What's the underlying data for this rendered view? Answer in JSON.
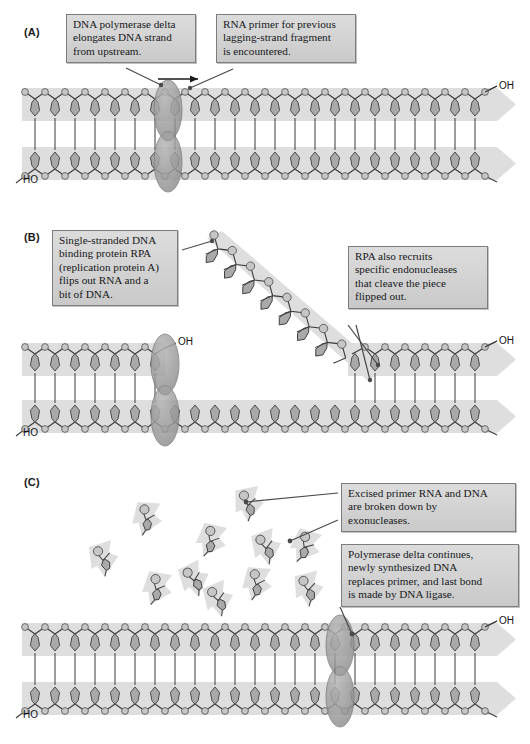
{
  "figure": {
    "background_color": "#ffffff",
    "ribbon_color": "#d9d9d9",
    "base_color": "#a8a8a8",
    "base_light_color": "#bfbfbf",
    "phosphate_color": "#c2c2c2",
    "protein_color": "#9a9a9a",
    "stroke_color": "#3c3c3c",
    "callout_fill": "#d4d4d4",
    "callout_border": "#7d7d7d"
  },
  "panels": [
    {
      "id": "A",
      "label": "(A)",
      "callouts": [
        {
          "name": "polymerase-delta-callout",
          "lines": [
            "DNA polymerase delta",
            "elongates DNA strand",
            "from upstream."
          ]
        },
        {
          "name": "rna-primer-callout",
          "lines": [
            "RNA primer for previous",
            "lagging-strand fragment",
            "is encountered."
          ]
        }
      ],
      "end_labels": [
        {
          "name": "top-strand-oh-label",
          "text": "OH"
        },
        {
          "name": "bottom-strand-ho-label",
          "text": "HO"
        }
      ],
      "proteins": [
        {
          "name": "dna-polymerase-delta",
          "shape": "double-ellipse"
        }
      ]
    },
    {
      "id": "B",
      "label": "(B)",
      "callouts": [
        {
          "name": "rpa-binding-callout",
          "lines": [
            "Single-stranded DNA",
            "binding protein RPA",
            "(replication protein A)",
            "flips out RNA and a",
            "bit of DNA."
          ]
        },
        {
          "name": "endonuclease-callout",
          "lines": [
            "RPA also recruits",
            "specific endonucleases",
            "that cleave the piece",
            "flipped out."
          ]
        }
      ],
      "end_labels": [
        {
          "name": "nascent-strand-oh-label",
          "text": "OH"
        },
        {
          "name": "top-strand-right-oh-label",
          "text": "OH"
        },
        {
          "name": "bottom-strand-ho-label",
          "text": "HO"
        }
      ],
      "proteins": [
        {
          "name": "dna-polymerase-delta",
          "shape": "double-ellipse"
        }
      ],
      "flap": {
        "name": "flipped-out-strand",
        "nucleotides": 10
      }
    },
    {
      "id": "C",
      "label": "(C)",
      "callouts": [
        {
          "name": "exonuclease-callout",
          "lines": [
            "Excised primer RNA and DNA",
            "are broken down by",
            "exonucleases."
          ]
        },
        {
          "name": "ligase-callout",
          "lines": [
            "Polymerase delta continues,",
            "newly synthesized DNA",
            "replaces primer, and last bond",
            "is made by DNA ligase."
          ]
        }
      ],
      "end_labels": [
        {
          "name": "top-strand-oh-label",
          "text": "OH"
        },
        {
          "name": "bottom-strand-ho-label",
          "text": "HO"
        }
      ],
      "proteins": [
        {
          "name": "dna-polymerase-delta",
          "shape": "double-ellipse"
        }
      ],
      "free_nucleotides": {
        "name": "degraded-nucleotide-pool",
        "count": 11
      }
    }
  ]
}
